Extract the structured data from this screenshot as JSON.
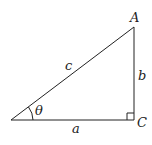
{
  "diagram": {
    "type": "right-triangle",
    "vertices": {
      "top": "A",
      "right_angle": "C"
    },
    "sides": {
      "hypotenuse": "c",
      "vertical": "b",
      "horizontal": "a"
    },
    "angle": "θ",
    "colors": {
      "stroke": "#222222",
      "background": "#ffffff"
    }
  }
}
